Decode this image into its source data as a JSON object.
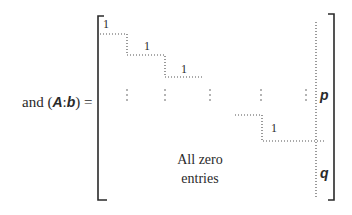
{
  "equation": {
    "prefix": "and (",
    "matrix_symbol": "A",
    "separator": ":",
    "vector_symbol": "b",
    "suffix": ") ="
  },
  "matrix": {
    "diagonal_entries": [
      "1",
      "1",
      "1",
      "1"
    ],
    "partition_labels": {
      "upper": "p",
      "lower": "q"
    },
    "zero_region_text_line1": "All zero",
    "zero_region_text_line2": "entries",
    "ellipsis_glyph": "⋮"
  },
  "colors": {
    "ink": "#2a2a2a",
    "dots": "#555555",
    "background": "#ffffff"
  }
}
